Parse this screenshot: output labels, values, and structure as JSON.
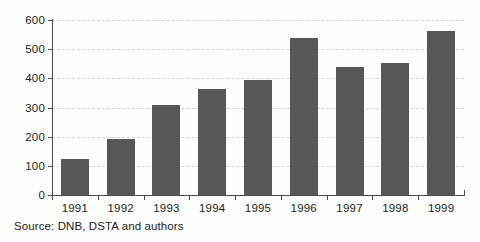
{
  "chart_data": {
    "type": "bar",
    "title": "",
    "subtitle": "",
    "xlabel": "",
    "ylabel": "",
    "categories": [
      "1991",
      "1992",
      "1993",
      "1994",
      "1995",
      "1996",
      "1997",
      "1998",
      "1999"
    ],
    "values": [
      123,
      192,
      308,
      362,
      393,
      540,
      440,
      452,
      563
    ],
    "series": [
      {
        "name": "",
        "values": [
          123,
          192,
          308,
          362,
          393,
          540,
          440,
          452,
          563
        ]
      }
    ],
    "ylim": [
      0,
      600
    ],
    "yticks": [
      0,
      100,
      200,
      300,
      400,
      500,
      600
    ],
    "ytick_labels": [
      "0",
      "100",
      "200",
      "300",
      "400",
      "500",
      "600"
    ],
    "grid": true,
    "grid_axis": "y",
    "grid_style": "dashed",
    "legend": false,
    "legend_position": "none",
    "bar_color": "#575757",
    "grid_color": "#d2d2d2",
    "axis_color": "#4a4a4a",
    "background_color": "#ffffff"
  },
  "footer": {
    "source_note": "Source: DNB, DSTA and authors"
  }
}
